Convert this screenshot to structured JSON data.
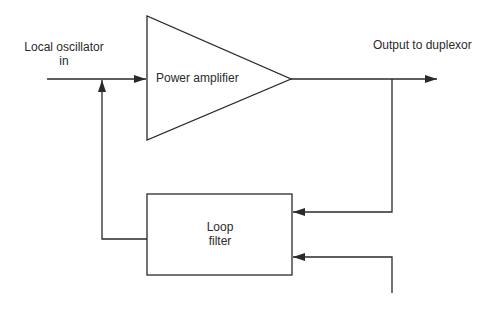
{
  "diagram": {
    "input_label_line1": "Local oscillator",
    "input_label_line2": "in",
    "amplifier_label": "Power amplifier",
    "output_label": "Output to duplexor",
    "filter_label_line1": "Loop",
    "filter_label_line2": "filter"
  },
  "colors": {
    "stroke": "#2a2a2a",
    "background": "#ffffff"
  }
}
